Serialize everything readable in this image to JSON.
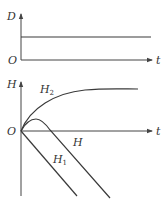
{
  "top_graph": {
    "y_axis_label": "D",
    "x_axis_label": "t",
    "origin_label": "O",
    "series": [
      {
        "name": "D",
        "shape": "constant horizontal line"
      }
    ]
  },
  "bottom_graph": {
    "y_axis_label": "H",
    "x_axis_label": "t",
    "origin_label": "O",
    "series": [
      {
        "name": "H2",
        "label_main": "H",
        "label_sub": "2",
        "shape": "rises from origin, saturates to plateau"
      },
      {
        "name": "H",
        "label_main": "H",
        "label_sub": "",
        "shape": "rises to small maximum then decreases linearly"
      },
      {
        "name": "H1",
        "label_main": "H",
        "label_sub": "1",
        "shape": "decreases linearly from origin"
      }
    ]
  },
  "colors": {
    "line": "#3a3a3a",
    "axis": "#444444",
    "background": "#ffffff"
  }
}
